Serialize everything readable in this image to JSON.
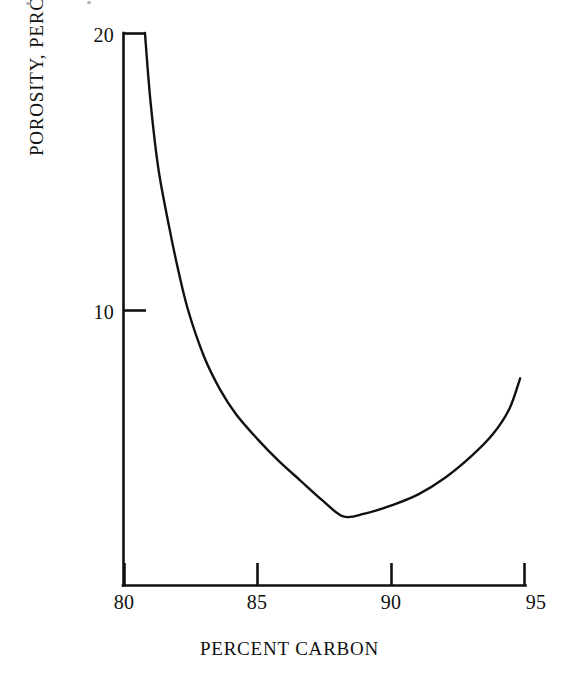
{
  "figure": {
    "background_color": "#ffffff",
    "ink_color": "#111111"
  },
  "chart_data": {
    "type": "line",
    "title": "",
    "subtitle": "",
    "xlabel": "PERCENT CARBON",
    "ylabel": "POROSITY, PERCENT",
    "xlim": [
      80,
      95
    ],
    "ylim": [
      0,
      20
    ],
    "xticks": [
      80,
      85,
      90,
      95
    ],
    "xtick_labels": [
      "80",
      "85",
      "90",
      "95"
    ],
    "yticks": [
      10,
      20
    ],
    "ytick_labels": [
      "10",
      "20"
    ],
    "grid": false,
    "legend": null,
    "legend_position": "none",
    "tick_direction": "in",
    "axes_spines": [
      "left",
      "bottom"
    ],
    "annotations": [],
    "series": [
      {
        "name": "porosity",
        "x": [
          80.8,
          81.0,
          81.3,
          81.7,
          82.0,
          82.4,
          83.0,
          83.6,
          84.2,
          85.0,
          85.8,
          86.6,
          87.4,
          88.2,
          89.0,
          90.0,
          91.0,
          92.0,
          93.0,
          93.8,
          94.4,
          94.8
        ],
        "y": [
          20.0,
          17.6,
          15.1,
          13.0,
          11.6,
          10.0,
          8.3,
          7.1,
          6.2,
          5.3,
          4.5,
          3.8,
          3.1,
          2.5,
          2.6,
          2.9,
          3.3,
          3.9,
          4.7,
          5.5,
          6.4,
          7.5
        ],
        "minimum": {
          "x": 88.2,
          "y": 2.5
        },
        "color": "#111111",
        "style": "solid",
        "marker": "none"
      }
    ]
  },
  "axis_labels": {
    "x_title": "PERCENT CARBON",
    "y_title": "POROSITY, PERCENT"
  },
  "ticks": {
    "y": [
      {
        "value": 20,
        "label": "20"
      },
      {
        "value": 10,
        "label": "10"
      }
    ],
    "x": [
      {
        "value": 80,
        "label": "80"
      },
      {
        "value": 85,
        "label": "85"
      },
      {
        "value": 90,
        "label": "90"
      },
      {
        "value": 95,
        "label": "95"
      }
    ]
  }
}
